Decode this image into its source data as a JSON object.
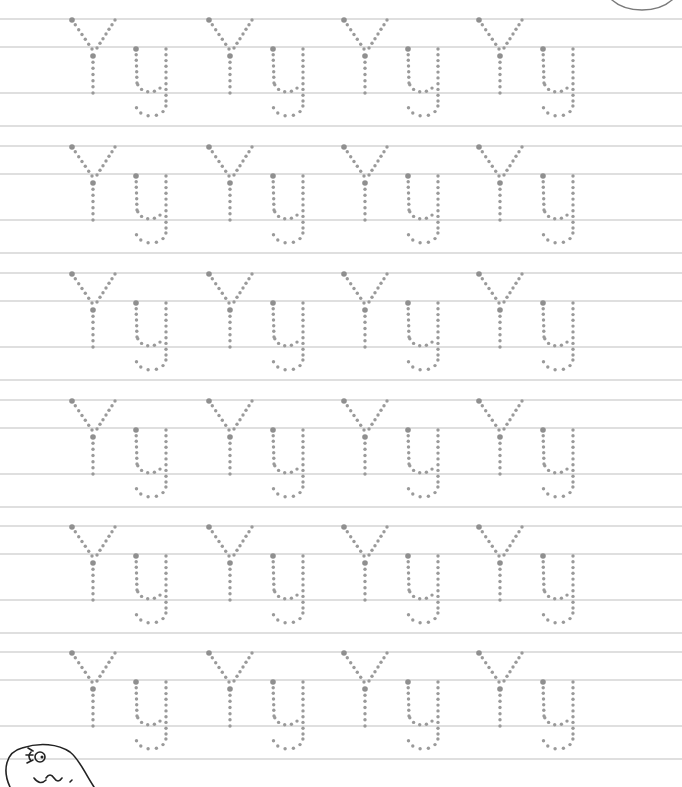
{
  "worksheet": {
    "letter_upper": "Y",
    "letter_lower": "y",
    "pair_label": "Yy",
    "rows": 6,
    "pairs_per_row": 4,
    "row_top_lines_y": [
      19,
      146,
      273,
      400,
      526,
      652
    ],
    "line_offsets": [
      0,
      28,
      74,
      107
    ],
    "pair_x": [
      72,
      209,
      344,
      479
    ],
    "colors": {
      "guide_line": "#d4d4d4",
      "dot": "#9a9a9a",
      "corner_circle": "#7a7a7a",
      "illustration": "#222222"
    }
  },
  "decorations": {
    "corner_circle": "top-right-circle",
    "illustration": "fish-mascot-illustration"
  }
}
